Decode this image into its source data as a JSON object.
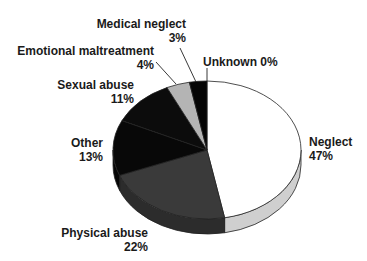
{
  "chart_data": {
    "type": "pie",
    "style": "3d",
    "title": "",
    "categories": [
      "Neglect",
      "Physical abuse",
      "Other",
      "Sexual abuse",
      "Emotional maltreatment",
      "Medical neglect",
      "Unknown"
    ],
    "values": [
      47,
      22,
      13,
      11,
      4,
      3,
      0
    ],
    "unit": "%",
    "colors": [
      "#ffffff",
      "#3a3a3a",
      "#080808",
      "#0c0c0c",
      "#b4b4b4",
      "#050505",
      "#ffffff"
    ],
    "legend": "none (direct labels)",
    "labels": [
      {
        "name": "Neglect",
        "value": "47%"
      },
      {
        "name": "Physical abuse",
        "value": "22%"
      },
      {
        "name": "Other",
        "value": "13%"
      },
      {
        "name": "Sexual abuse",
        "value": "11%"
      },
      {
        "name": "Emotional maltreatment",
        "value": "4%"
      },
      {
        "name": "Medical neglect",
        "value": "3%"
      },
      {
        "name": "Unknown",
        "value": "0%"
      }
    ]
  }
}
